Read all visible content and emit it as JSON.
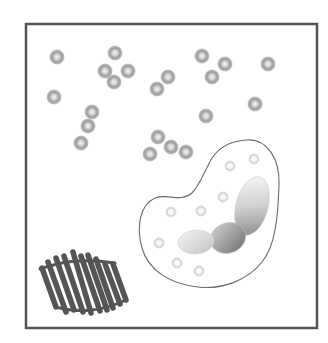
{
  "diagram": {
    "frame": {
      "x": 26,
      "y": 24,
      "width": 291,
      "height": 304,
      "stroke": "#555555",
      "stroke_width": 2.5
    },
    "colors": {
      "background": "#ffffff",
      "granule_ring": "#9a9a9a",
      "granule_center": "#e6e6e6",
      "cell_outline": "#6b6b6b",
      "vesicle_ring": "#d2d2d2",
      "nucleus_dark": "#8a8a8a",
      "nucleus_light": "#f0f0f0",
      "fiber_mass": "#555555"
    },
    "free_granules": [
      {
        "x": 57,
        "y": 57
      },
      {
        "x": 115,
        "y": 53
      },
      {
        "x": 105,
        "y": 71
      },
      {
        "x": 128,
        "y": 71
      },
      {
        "x": 114,
        "y": 82
      },
      {
        "x": 54,
        "y": 97
      },
      {
        "x": 92,
        "y": 112
      },
      {
        "x": 88,
        "y": 126
      },
      {
        "x": 81,
        "y": 143
      },
      {
        "x": 202,
        "y": 56
      },
      {
        "x": 225,
        "y": 64
      },
      {
        "x": 212,
        "y": 77
      },
      {
        "x": 268,
        "y": 64
      },
      {
        "x": 168,
        "y": 77
      },
      {
        "x": 157,
        "y": 89
      },
      {
        "x": 255,
        "y": 104
      },
      {
        "x": 206,
        "y": 116
      },
      {
        "x": 158,
        "y": 137
      },
      {
        "x": 171,
        "y": 147
      },
      {
        "x": 186,
        "y": 152
      },
      {
        "x": 150,
        "y": 154
      }
    ],
    "cell": {
      "label": "phagocytic cell",
      "vesicles": [
        {
          "x": 230,
          "y": 166
        },
        {
          "x": 254,
          "y": 159
        },
        {
          "x": 223,
          "y": 197
        },
        {
          "x": 171,
          "y": 212
        },
        {
          "x": 201,
          "y": 211
        },
        {
          "x": 159,
          "y": 243
        },
        {
          "x": 177,
          "y": 263
        },
        {
          "x": 199,
          "y": 271
        }
      ],
      "nucleus_lobes": [
        {
          "cx": 194,
          "cy": 242,
          "rx": 17,
          "ry": 12,
          "rot": -5
        },
        {
          "cx": 228,
          "cy": 238,
          "rx": 18,
          "ry": 16,
          "rot": -20
        },
        {
          "cx": 252,
          "cy": 206,
          "rx": 17,
          "ry": 30,
          "rot": 15
        }
      ]
    },
    "fiber_mass": {
      "label": "coiled fiber mass",
      "coils": 10
    }
  }
}
